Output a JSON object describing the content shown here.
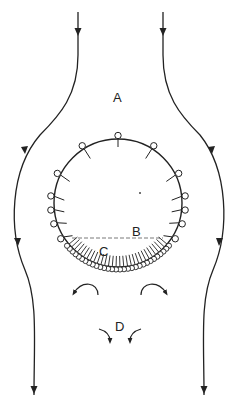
{
  "diagram": {
    "type": "flow-around-sphere",
    "colors": {
      "ink": "#222222",
      "background": "#ffffff"
    },
    "labels": {
      "A": "A",
      "B": "B",
      "C": "C",
      "D": "D"
    },
    "sphere": {
      "cx": 118,
      "cy": 203,
      "r": 64
    },
    "upper_cilia_count": 14,
    "lower_bead_count": 30,
    "streamlines": [
      "left",
      "right"
    ],
    "vortices": [
      "upper-left",
      "upper-right",
      "lower-left",
      "lower-right"
    ]
  }
}
